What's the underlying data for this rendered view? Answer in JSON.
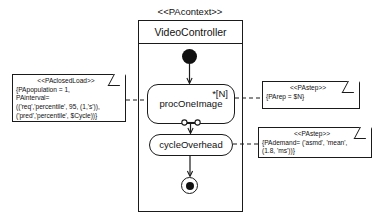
{
  "diagram": {
    "kind": "uml-activity-diagram",
    "context_stereotype": "<<PAcontext>>",
    "frame_title": "VideoController",
    "nodes": {
      "initial": "initial-node",
      "proc_one_image": {
        "label": "procOneImage",
        "multiplicity": "*[N]",
        "sub_activity_icon": "subactivity-icon"
      },
      "cycle_overhead": {
        "label": "cycleOverhead"
      },
      "final": "activity-final-node"
    },
    "notes": [
      {
        "id": "paclosedload",
        "stereotype": "<<PAclosedLoad>>",
        "lines": [
          "{PApopulation = 1,",
          "PAinterval=",
          "  (('req','percentile', 95, (1,'s')),",
          "   ('pred','percentile', $Cycle))}"
        ]
      },
      {
        "id": "pastep-rep",
        "stereotype": "<<PAstep>>",
        "lines": [
          "{PArep = $N}"
        ]
      },
      {
        "id": "pastep-demand",
        "stereotype": "<<PAstep>>",
        "lines": [
          "{PAdemand= ('asmd', 'mean',",
          "(1.8, 'ms'))}"
        ]
      }
    ],
    "colors": {
      "stroke": "#1a1a1a",
      "fill": "#ffffff",
      "solid": "#111111"
    }
  }
}
